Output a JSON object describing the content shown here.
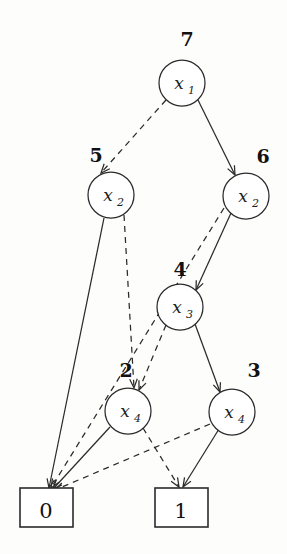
{
  "figure": {
    "type": "binary-decision-diagram",
    "background_color": "#fdfdfc",
    "ink_color": "#2b2b2b",
    "width": 287,
    "height": 554
  },
  "nodes": [
    {
      "id": "n7",
      "index_label": "7",
      "variable": "x",
      "subscript": "1",
      "variable_label": "x1",
      "cx": 182,
      "cy": 83,
      "r": 23,
      "index_x": 187,
      "index_y": 46,
      "low_child": "n5",
      "high_child": "n6"
    },
    {
      "id": "n5",
      "index_label": "5",
      "variable": "x",
      "subscript": "2",
      "variable_label": "x2",
      "cx": 111,
      "cy": 195,
      "r": 23,
      "index_x": 96,
      "index_y": 162,
      "low_child": "t0",
      "high_child": "n2"
    },
    {
      "id": "n6",
      "index_label": "6",
      "variable": "x",
      "subscript": "2",
      "variable_label": "x2",
      "cx": 246,
      "cy": 196,
      "r": 23,
      "index_x": 263,
      "index_y": 163,
      "low_child": "t0",
      "high_child": "n4"
    },
    {
      "id": "n4",
      "index_label": "4",
      "variable": "x",
      "subscript": "3",
      "variable_label": "x3",
      "cx": 180,
      "cy": 307,
      "r": 23,
      "index_x": 180,
      "index_y": 276,
      "low_child": "n2",
      "high_child": "n3"
    },
    {
      "id": "n2",
      "index_label": "2",
      "variable": "x",
      "subscript": "4",
      "variable_label": "x4",
      "cx": 128,
      "cy": 411,
      "r": 23,
      "index_x": 126,
      "index_y": 377,
      "low_child": "t0",
      "high_child": "t1"
    },
    {
      "id": "n3",
      "index_label": "3",
      "variable": "x",
      "subscript": "4",
      "variable_label": "x4",
      "cx": 232,
      "cy": 412,
      "r": 23,
      "index_x": 254,
      "index_y": 377,
      "low_child": "t0",
      "high_child": "t1"
    }
  ],
  "terminals": [
    {
      "id": "t0",
      "label": "0",
      "x": 20,
      "y": 488,
      "width": 53,
      "height": 39,
      "text_x": 46,
      "text_y": 518
    },
    {
      "id": "t1",
      "label": "1",
      "x": 155,
      "y": 488,
      "width": 53,
      "height": 39,
      "text_x": 181,
      "text_y": 518
    }
  ],
  "edges": [
    {
      "from": "n7",
      "to": "n5",
      "style": "dashed",
      "x1": 166,
      "y1": 100,
      "x2": 101,
      "y2": 173
    },
    {
      "from": "n7",
      "to": "n6",
      "style": "solid",
      "x1": 198,
      "y1": 100,
      "x2": 235,
      "y2": 175
    },
    {
      "from": "n5",
      "to": "t0",
      "style": "solid",
      "x1": 104,
      "y1": 218,
      "x2": 49,
      "y2": 488
    },
    {
      "from": "n5",
      "to": "n2",
      "style": "dashed",
      "x1": 124,
      "y1": 215,
      "x2": 134,
      "y2": 388
    },
    {
      "from": "n6",
      "to": "t0",
      "style": "dashed",
      "x1": 224,
      "y1": 208,
      "x2": 51,
      "y2": 488
    },
    {
      "from": "n6",
      "to": "n4",
      "style": "solid",
      "x1": 231,
      "y1": 213,
      "x2": 196,
      "y2": 290
    },
    {
      "from": "n4",
      "to": "n2",
      "style": "dashed",
      "x1": 166,
      "y1": 325,
      "x2": 139,
      "y2": 390
    },
    {
      "from": "n4",
      "to": "n3",
      "style": "solid",
      "x1": 195,
      "y1": 324,
      "x2": 220,
      "y2": 392
    },
    {
      "from": "n2",
      "to": "t0",
      "style": "solid",
      "x1": 110,
      "y1": 427,
      "x2": 53,
      "y2": 489
    },
    {
      "from": "n2",
      "to": "t1",
      "style": "dashed",
      "x1": 143,
      "y1": 428,
      "x2": 179,
      "y2": 487
    },
    {
      "from": "n3",
      "to": "t0",
      "style": "dashed",
      "x1": 210,
      "y1": 424,
      "x2": 55,
      "y2": 490
    },
    {
      "from": "n3",
      "to": "t1",
      "style": "solid",
      "x1": 219,
      "y1": 429,
      "x2": 183,
      "y2": 487
    }
  ],
  "legend": {
    "solid_meaning": "high edge",
    "dashed_meaning": "low edge"
  }
}
